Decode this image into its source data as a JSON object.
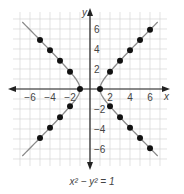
{
  "chart_data": {
    "type": "scatter",
    "title": "",
    "caption": "x² − y² = 1",
    "xlabel": "x",
    "ylabel": "y",
    "xlim": [
      -7,
      7
    ],
    "ylim": [
      -7,
      7
    ],
    "grid": true,
    "x_ticks": [
      -6,
      -4,
      -2,
      2,
      4,
      6
    ],
    "y_ticks": [
      6,
      4,
      2,
      -2,
      -4,
      -6
    ],
    "curve": "hyperbola x^2 - y^2 = 1",
    "series": [
      {
        "name": "right-upper",
        "points": [
          [
            1,
            0
          ],
          [
            2,
            1.73
          ],
          [
            3,
            2.83
          ],
          [
            4,
            3.87
          ],
          [
            5,
            4.9
          ],
          [
            6,
            5.92
          ]
        ]
      },
      {
        "name": "right-lower",
        "points": [
          [
            2,
            -1.73
          ],
          [
            3,
            -2.83
          ],
          [
            4,
            -3.87
          ],
          [
            5,
            -4.9
          ],
          [
            6,
            -5.92
          ]
        ]
      },
      {
        "name": "left-upper",
        "points": [
          [
            -1,
            0
          ],
          [
            -2,
            1.73
          ],
          [
            -3,
            2.83
          ],
          [
            -4,
            3.87
          ],
          [
            -5,
            4.9
          ]
        ]
      },
      {
        "name": "left-lower",
        "points": [
          [
            -2,
            -1.73
          ],
          [
            -3,
            -2.83
          ],
          [
            -4,
            -3.87
          ],
          [
            -5,
            -4.9
          ]
        ]
      }
    ],
    "colors": {
      "curve": "#8a8a8a",
      "points": "#111111",
      "grid": "#d6d6d6",
      "axis": "#222222"
    }
  },
  "labels": {
    "x_axis": "x",
    "y_axis": "y",
    "equation": "x² − y² = 1",
    "xt": [
      "−6",
      "−4",
      "−2",
      "2",
      "4",
      "6"
    ],
    "yt": [
      "6",
      "4",
      "2",
      "−2",
      "−4",
      "−6"
    ]
  }
}
